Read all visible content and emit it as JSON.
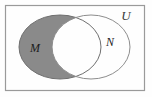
{
  "figure": {
    "kind": "venn-diagram",
    "width": 152,
    "height": 97,
    "background_color": "#fefefe",
    "shaded_description": "M minus N",
    "frame": {
      "name": "universe-rectangle",
      "x": 5.5,
      "y": 5.5,
      "width": 139,
      "height": 85,
      "stroke_color": "#9a9a9a",
      "stroke_width": 1.2,
      "fill": "none"
    },
    "labels": {
      "universe": "U",
      "set_left": "M",
      "set_right": "N"
    },
    "label_positions": {
      "universe": {
        "x": 126,
        "y": 20,
        "font_size": 13
      },
      "set_left": {
        "x": 35,
        "y": 52,
        "font_size": 12
      },
      "set_right": {
        "x": 110,
        "y": 46,
        "font_size": 12
      }
    },
    "sets": [
      {
        "name": "M",
        "label": "M",
        "cx": 60,
        "cy": 47,
        "rx": 41,
        "ry": 32,
        "fill_color": "#8a8a8a",
        "stroke_color": "#6f6f6f",
        "stroke_width": 1,
        "shaded": true
      },
      {
        "name": "N",
        "label": "N",
        "cx": 91,
        "cy": 47,
        "rx": 39,
        "ry": 32,
        "fill_color": "#ffffff",
        "stroke_color": "#8d8d8d",
        "stroke_width": 1,
        "shaded": false
      }
    ],
    "colors": {
      "shade_gray": "#8a8a8a",
      "outline_gray": "#8d8d8d",
      "frame_gray": "#9a9a9a",
      "text_black": "#1c1c1c",
      "page_white": "#fefefe"
    }
  }
}
